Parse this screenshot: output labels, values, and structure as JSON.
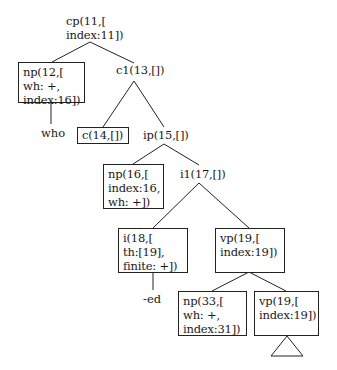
{
  "diagram": {
    "type": "syntax-tree",
    "nodes": {
      "cp11": {
        "label": "cp(11,[\nindex:11])",
        "boxed": false
      },
      "np12": {
        "label": "np(12,[\nwh: +,\nindex:16])",
        "boxed": true
      },
      "c1_13": {
        "label": "c1(13,[])",
        "boxed": false
      },
      "who": {
        "label": "who",
        "boxed": false
      },
      "c14": {
        "label": "c(14,[])",
        "boxed": true
      },
      "ip15": {
        "label": "ip(15,[])",
        "boxed": false
      },
      "np16": {
        "label": "np(16,[\nindex:16,\nwh: +])",
        "boxed": true
      },
      "i1_17": {
        "label": "i1(17,[])",
        "boxed": false
      },
      "i18": {
        "label": "i(18,[\nth:[19],\nfinite: +])",
        "boxed": true
      },
      "vp19a": {
        "label": "vp(19,[\nindex:19])",
        "boxed": true
      },
      "ed": {
        "label": "-ed",
        "boxed": false
      },
      "np33": {
        "label": "np(33,[\nwh: +,\nindex:31])",
        "boxed": true
      },
      "vp19b": {
        "label": "vp(19,[\nindex:19])",
        "boxed": true
      }
    },
    "edges": [
      [
        "cp11",
        "np12"
      ],
      [
        "cp11",
        "c1_13"
      ],
      [
        "np12",
        "who"
      ],
      [
        "c1_13",
        "c14"
      ],
      [
        "c1_13",
        "ip15"
      ],
      [
        "ip15",
        "np16"
      ],
      [
        "ip15",
        "i1_17"
      ],
      [
        "i1_17",
        "i18"
      ],
      [
        "i1_17",
        "vp19a"
      ],
      [
        "i18",
        "ed"
      ],
      [
        "vp19a",
        "np33"
      ],
      [
        "vp19a",
        "vp19b"
      ],
      [
        "vp19b",
        "triangle"
      ]
    ],
    "colors": {
      "line": "#222222",
      "text": "#1a1a1a",
      "background": "#ffffff"
    }
  }
}
